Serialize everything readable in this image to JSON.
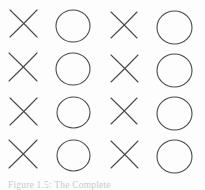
{
  "figure": {
    "caption": "Figure 1.5: The Complete",
    "stroke_color": "#4a4a4a",
    "background_color": "#fdfdfd",
    "stroke_width": 1.1,
    "columns": 4,
    "rows": 4,
    "column_centers": [
      23,
      73,
      124,
      174
    ],
    "row_centers": [
      23,
      67,
      111,
      154
    ],
    "symbol_size": 34,
    "grid": [
      [
        {
          "symbol": "cross",
          "label": "X",
          "col": 1,
          "row": 1,
          "cx": 23,
          "cy": 23,
          "size": 27
        },
        {
          "symbol": "circle",
          "label": "O",
          "col": 2,
          "row": 1,
          "cx": 73,
          "cy": 26,
          "size": 34
        },
        {
          "symbol": "cross",
          "label": "X",
          "col": 3,
          "row": 1,
          "cx": 124,
          "cy": 25,
          "size": 26
        },
        {
          "symbol": "circle",
          "label": "O",
          "col": 4,
          "row": 1,
          "cx": 174,
          "cy": 27,
          "size": 35
        }
      ],
      [
        {
          "symbol": "cross",
          "label": "X",
          "col": 1,
          "row": 2,
          "cx": 23,
          "cy": 67,
          "size": 28
        },
        {
          "symbol": "circle",
          "label": "O",
          "col": 2,
          "row": 2,
          "cx": 73,
          "cy": 69,
          "size": 34
        },
        {
          "symbol": "cross",
          "label": "X",
          "col": 3,
          "row": 2,
          "cx": 124,
          "cy": 68,
          "size": 27
        },
        {
          "symbol": "circle",
          "label": "O",
          "col": 4,
          "row": 2,
          "cx": 174,
          "cy": 70,
          "size": 35
        }
      ],
      [
        {
          "symbol": "cross",
          "label": "X",
          "col": 1,
          "row": 3,
          "cx": 23,
          "cy": 111,
          "size": 27
        },
        {
          "symbol": "circle",
          "label": "O",
          "col": 2,
          "row": 3,
          "cx": 73,
          "cy": 112,
          "size": 33
        },
        {
          "symbol": "cross",
          "label": "X",
          "col": 3,
          "row": 3,
          "cx": 124,
          "cy": 111,
          "size": 26
        },
        {
          "symbol": "circle",
          "label": "O",
          "col": 4,
          "row": 3,
          "cx": 174,
          "cy": 113,
          "size": 35
        }
      ],
      [
        {
          "symbol": "cross",
          "label": "X",
          "col": 1,
          "row": 4,
          "cx": 23,
          "cy": 154,
          "size": 28
        },
        {
          "symbol": "circle",
          "label": "O",
          "col": 2,
          "row": 4,
          "cx": 73,
          "cy": 155,
          "size": 33
        },
        {
          "symbol": "cross",
          "label": "X",
          "col": 3,
          "row": 4,
          "cx": 124,
          "cy": 154,
          "size": 27
        },
        {
          "symbol": "circle",
          "label": "O",
          "col": 4,
          "row": 4,
          "cx": 174,
          "cy": 156,
          "size": 35
        }
      ]
    ]
  }
}
